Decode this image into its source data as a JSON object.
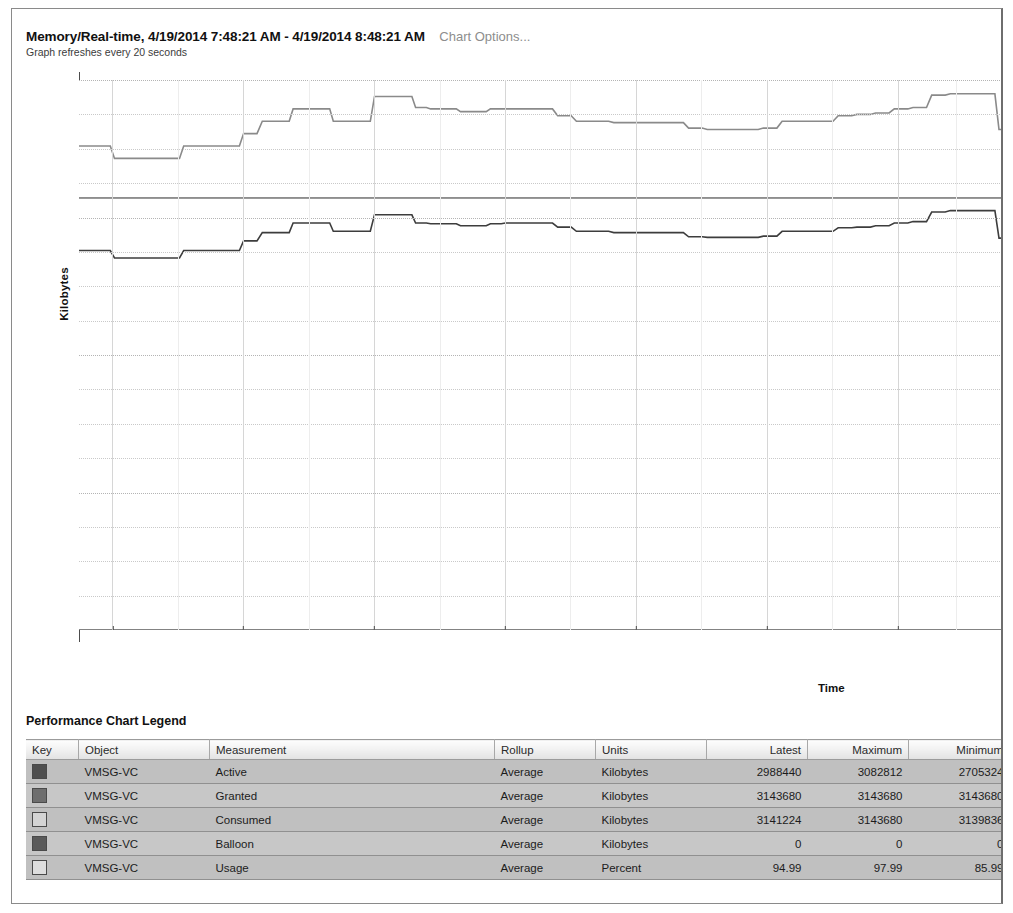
{
  "header": {
    "title": "Memory/Real-time, 4/19/2014 7:48:21 AM - 4/19/2014 8:48:21 AM",
    "options_link": "Chart Options...",
    "subtitle": "Graph refreshes every 20 seconds"
  },
  "legend": {
    "title": "Performance Chart Legend",
    "columns": [
      "Key",
      "Object",
      "Measurement",
      "Rollup",
      "Units",
      "Latest",
      "Maximum",
      "Minimum",
      "Average"
    ],
    "rows": [
      {
        "key_color": "#4f4f4f",
        "object": "VMSG-VC",
        "measurement": "Active",
        "rollup": "Average",
        "units": "Kilobytes",
        "latest": "2988440",
        "maximum": "3082812",
        "minimum": "2705324",
        "average": "2920107."
      },
      {
        "key_color": "#6e6e6e",
        "object": "VMSG-VC",
        "measurement": "Granted",
        "rollup": "Average",
        "units": "Kilobytes",
        "latest": "3143680",
        "maximum": "3143680",
        "minimum": "3143680",
        "average": "3143680"
      },
      {
        "key_color": "#d4d4d4",
        "object": "VMSG-VC",
        "measurement": "Consumed",
        "rollup": "Average",
        "units": "Kilobytes",
        "latest": "3141224",
        "maximum": "3143680",
        "minimum": "3139836",
        "average": "3142858."
      },
      {
        "key_color": "#5a5a5a",
        "object": "VMSG-VC",
        "measurement": "Balloon",
        "rollup": "Average",
        "units": "Kilobytes",
        "latest": "0",
        "maximum": "0",
        "minimum": "0",
        "average": "0"
      },
      {
        "key_color": "#dedede",
        "object": "VMSG-VC",
        "measurement": "Usage",
        "rollup": "Average",
        "units": "Percent",
        "latest": "94.99",
        "maximum": "97.99",
        "minimum": "85.99",
        "average": "92.811"
      }
    ]
  },
  "chart_data": {
    "type": "line",
    "title": "Memory/Real-time, 4/19/2014 7:48:21 AM - 4/19/2014 8:48:21 AM",
    "xlabel": "Time",
    "ylabel": "Kilobytes",
    "ylim": [
      0,
      4000000
    ],
    "y_major_ticks": [
      0,
      1000000,
      2000000,
      3000000,
      4000000
    ],
    "y_minor_step": 250000,
    "grid": true,
    "legend_position": "below-table",
    "x_tick_labels": [
      "7:50 AM",
      "7:55 AM",
      "8:00 AM",
      "8:05 AM",
      "8:10 AM",
      "8:15 AM",
      "8:20 AM",
      "8:25 AM"
    ],
    "x_tick_positions": [
      0.0357,
      0.1756,
      0.3156,
      0.4556,
      0.5955,
      0.7355,
      0.8755,
      1.0
    ],
    "x_minor_divisions_per_major": 2,
    "series": [
      {
        "name": "Usage",
        "color": "#8a8a8a",
        "note": "Percent series rendered on upper band of same axis",
        "x": [
          0,
          0.022,
          0.038,
          0.052,
          0.066,
          0.096,
          0.112,
          0.128,
          0.16,
          0.176,
          0.196,
          0.214,
          0.229,
          0.242,
          0.258,
          0.272,
          0.288,
          0.3,
          0.316,
          0.33,
          0.346,
          0.36,
          0.376,
          0.392,
          0.408,
          0.424,
          0.44,
          0.456,
          0.472,
          0.492,
          0.512,
          0.532,
          0.552,
          0.572,
          0.592,
          0.612,
          0.632,
          0.652,
          0.672,
          0.692,
          0.712,
          0.732,
          0.752,
          0.772,
          0.792,
          0.812,
          0.832,
          0.852,
          0.872,
          0.892,
          0.912,
          0.932,
          0.952,
          0.968,
          0.984,
          1.0
        ],
        "y": [
          3520000,
          3520000,
          3430000,
          3430000,
          3430000,
          3430000,
          3520000,
          3520000,
          3520000,
          3610000,
          3700000,
          3700000,
          3790000,
          3790000,
          3790000,
          3700000,
          3700000,
          3700000,
          3880000,
          3880000,
          3880000,
          3800000,
          3790000,
          3790000,
          3770000,
          3770000,
          3790000,
          3790000,
          3790000,
          3790000,
          3740000,
          3700000,
          3700000,
          3690000,
          3690000,
          3690000,
          3690000,
          3650000,
          3640000,
          3640000,
          3640000,
          3650000,
          3700000,
          3700000,
          3700000,
          3740000,
          3750000,
          3760000,
          3790000,
          3800000,
          3890000,
          3900000,
          3900000,
          3900000,
          3640000,
          3630000
        ]
      },
      {
        "name": "Granted",
        "color": "#6e6e6e",
        "note": "Flat constant line at 3143680",
        "x": [
          0,
          1.0
        ],
        "y": [
          3143680,
          3143680
        ]
      },
      {
        "name": "Consumed",
        "color": "#9a9a9a",
        "note": "Nearly flat, overlaps Granted",
        "x": [
          0,
          1.0
        ],
        "y": [
          3141224,
          3141224
        ]
      },
      {
        "name": "Active",
        "color": "#3d3d3d",
        "x": [
          0,
          0.022,
          0.038,
          0.052,
          0.066,
          0.096,
          0.112,
          0.128,
          0.16,
          0.176,
          0.196,
          0.214,
          0.229,
          0.242,
          0.258,
          0.272,
          0.288,
          0.3,
          0.316,
          0.33,
          0.346,
          0.36,
          0.376,
          0.392,
          0.408,
          0.424,
          0.44,
          0.456,
          0.472,
          0.492,
          0.512,
          0.532,
          0.552,
          0.572,
          0.592,
          0.612,
          0.632,
          0.652,
          0.672,
          0.692,
          0.712,
          0.732,
          0.752,
          0.772,
          0.792,
          0.812,
          0.832,
          0.852,
          0.872,
          0.892,
          0.912,
          0.932,
          0.952,
          0.968,
          0.984,
          1.0
        ],
        "y": [
          2760000,
          2760000,
          2705324,
          2705324,
          2705324,
          2705324,
          2760000,
          2760000,
          2760000,
          2830000,
          2890000,
          2890000,
          2960000,
          2960000,
          2960000,
          2900000,
          2900000,
          2900000,
          3020000,
          3020000,
          3020000,
          2960000,
          2955000,
          2955000,
          2940000,
          2940000,
          2955000,
          2960000,
          2960000,
          2960000,
          2930000,
          2900000,
          2900000,
          2890000,
          2890000,
          2890000,
          2890000,
          2860000,
          2855000,
          2855000,
          2855000,
          2865000,
          2900000,
          2900000,
          2900000,
          2925000,
          2930000,
          2940000,
          2960000,
          2970000,
          3040000,
          3050000,
          3050000,
          3050000,
          2850000,
          2845000
        ]
      },
      {
        "name": "Balloon",
        "color": "#5a5a5a",
        "note": "Constant zero, lies on x-axis",
        "x": [
          0,
          1.0
        ],
        "y": [
          0,
          0
        ]
      }
    ]
  }
}
